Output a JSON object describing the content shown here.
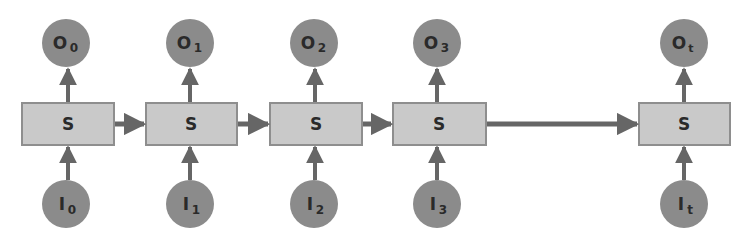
{
  "diagram": {
    "type": "unrolled-recurrent-network",
    "colors": {
      "background": "#ffffff",
      "circle_fill": "#8b8b8b",
      "box_fill": "#c9c9c9",
      "box_stroke": "#8e8e8e",
      "arrow": "#666666",
      "text": "#2a2a2a"
    },
    "steps": [
      {
        "state": "S",
        "output": "O",
        "output_sub": "0",
        "input": "I",
        "input_sub": "0",
        "cx": 68
      },
      {
        "state": "S",
        "output": "O",
        "output_sub": "1",
        "input": "I",
        "input_sub": "1",
        "cx": 191
      },
      {
        "state": "S",
        "output": "O",
        "output_sub": "2",
        "input": "I",
        "input_sub": "2",
        "cx": 316
      },
      {
        "state": "S",
        "output": "O",
        "output_sub": "3",
        "input": "I",
        "input_sub": "3",
        "cx": 439
      },
      {
        "state": "S",
        "output": "O",
        "output_sub": "t",
        "input": "I",
        "input_sub": "t",
        "cx": 684
      }
    ],
    "connections": [
      {
        "from": 0,
        "to": 1
      },
      {
        "from": 1,
        "to": 2
      },
      {
        "from": 2,
        "to": 3
      },
      {
        "from": 3,
        "to": 4
      }
    ]
  }
}
